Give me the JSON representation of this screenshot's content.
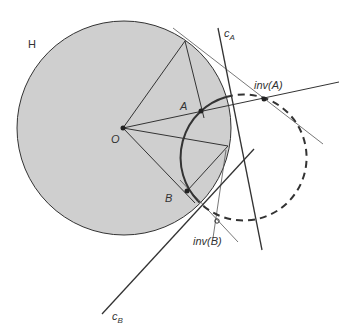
{
  "diagram": {
    "colors": {
      "disk_fill": "#cfcfcf",
      "stroke": "#333333",
      "thin_stroke": "#555555",
      "background": "#ffffff"
    },
    "circle_H": {
      "label": "H",
      "cx": 124,
      "cy": 128,
      "r": 107,
      "label_x": 28,
      "label_y": 48
    },
    "center_O": {
      "label": "O",
      "x": 123,
      "y": 128,
      "label_x": 111,
      "label_y": 143
    },
    "points": [
      {
        "id": "A",
        "label": "A",
        "x": 201,
        "y": 111,
        "label_x": 180,
        "label_y": 110
      },
      {
        "id": "B",
        "label": "B",
        "x": 187,
        "y": 191,
        "label_x": 165,
        "label_y": 202
      },
      {
        "id": "invA",
        "label": "inv(A)",
        "x": 264,
        "y": 99,
        "label_x": 254,
        "label_y": 89
      },
      {
        "id": "invB",
        "label": "inv(B)",
        "x": 217,
        "y": 221,
        "label_x": 193,
        "label_y": 245
      }
    ],
    "lines": {
      "c_A": {
        "label": "c",
        "sub": "A",
        "x1": 218,
        "y1": 28,
        "x2": 262,
        "y2": 250,
        "label_x": 225,
        "label_y": 37
      },
      "c_B": {
        "label": "c",
        "sub": "B",
        "x1": 102,
        "y1": 314,
        "x2": 254,
        "y2": 149,
        "label_x": 112,
        "label_y": 320
      }
    },
    "orthogonal_circle": {
      "cx": 244,
      "cy": 158,
      "r": 63
    }
  }
}
